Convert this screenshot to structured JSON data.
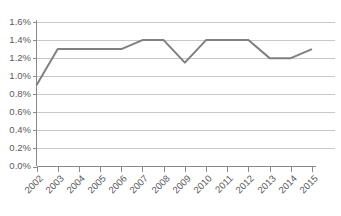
{
  "chart_data": {
    "type": "line",
    "title": "",
    "xlabel": "",
    "ylabel": "",
    "categories": [
      "2002",
      "2003",
      "2004",
      "2005",
      "2006",
      "2007",
      "2008",
      "2009",
      "2010",
      "2011",
      "2012",
      "2013",
      "2014",
      "2015"
    ],
    "values": [
      0.9,
      1.3,
      1.3,
      1.3,
      1.3,
      1.4,
      1.4,
      1.15,
      1.4,
      1.4,
      1.4,
      1.2,
      1.2,
      1.3
    ],
    "ylim": [
      0.0,
      1.6
    ],
    "ytick_values": [
      1.6,
      1.4,
      1.2,
      1.0,
      0.8,
      0.6,
      0.4,
      0.2,
      0.0
    ],
    "ytick_labels": [
      "1.6%",
      "1.4%",
      "1.2%",
      "1.0%",
      "0.8%",
      "0.6%",
      "0.4%",
      "0.2%",
      "0.0%"
    ],
    "grid": true,
    "legend": false,
    "legend_position": "none",
    "series_color": "#808080",
    "grid_color": "#c8c8c8",
    "axis_color": "#8a8a8a",
    "label_color": "#5a5a5a",
    "xtick_label_rotation": -45
  }
}
